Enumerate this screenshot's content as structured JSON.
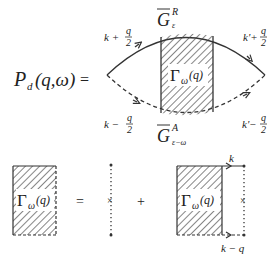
{
  "equation1": {
    "lhs": {
      "symbol": "P",
      "subscript": "d",
      "args": "(q,ω)"
    },
    "equals": "=",
    "top_propagator": {
      "symbol": "G",
      "superscript": "R",
      "subscript": "ε"
    },
    "bottom_propagator": {
      "symbol": "G",
      "superscript": "A",
      "subscript": "ε−ω"
    },
    "vertex": {
      "symbol": "Γ",
      "subscript": "ω",
      "args": "(q)"
    },
    "momenta": {
      "top_left": {
        "base": "k +",
        "num": "q",
        "den": "2"
      },
      "bottom_left": {
        "base": "k −",
        "num": "q",
        "den": "2"
      },
      "top_right": {
        "base": "k'+",
        "num": "q",
        "den": "2"
      },
      "bottom_right": {
        "base": "k'−",
        "num": "q",
        "den": "2"
      }
    }
  },
  "equation2": {
    "lhs_vertex": {
      "symbol": "Γ",
      "subscript": "ω",
      "args": "(q)"
    },
    "equals": "=",
    "plus": "+",
    "impurity_mark": "×",
    "rhs_vertex": {
      "symbol": "Γ",
      "subscript": "ω",
      "args": "(q)"
    },
    "top_momentum": "k",
    "bottom_momentum": "k − q"
  },
  "colors": {
    "line": "#333333",
    "hatch": "#444444",
    "background": "#ffffff"
  }
}
